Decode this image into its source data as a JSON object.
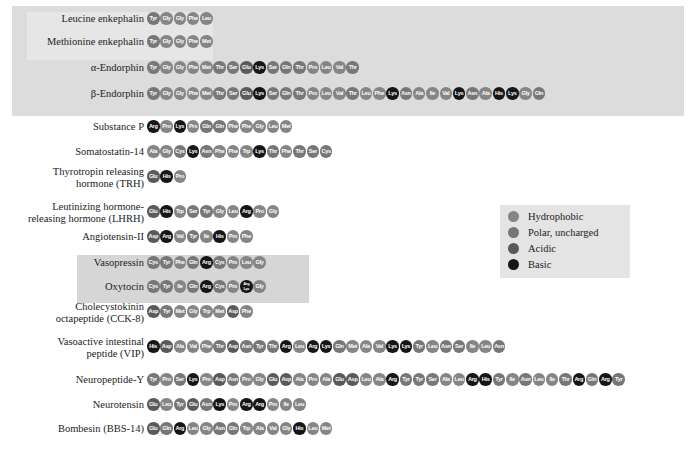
{
  "legend": {
    "items": [
      {
        "label": "Hydrophobic",
        "class": "h",
        "color": "#858585"
      },
      {
        "label": "Polar, uncharged",
        "class": "p",
        "color": "#777777"
      },
      {
        "label": "Acidic",
        "class": "a",
        "color": "#5a5a5a"
      },
      {
        "label": "Basic",
        "class": "b",
        "color": "#161616"
      }
    ]
  },
  "peptides": [
    {
      "name": "Leucine enkephalin",
      "y": 18,
      "seq": [
        "Tyr",
        "Gly",
        "Gly",
        "Phe",
        "Leu"
      ]
    },
    {
      "name": "Methionine enkephalin",
      "y": 41,
      "seq": [
        "Tyr",
        "Gly",
        "Gly",
        "Phe",
        "Met"
      ]
    },
    {
      "name": "α-Endorphin",
      "y": 67,
      "seq": [
        "Tyr",
        "Gly",
        "Gly",
        "Phe",
        "Met",
        "Thr",
        "Ser",
        "Glu",
        "Lys",
        "Ser",
        "Gln",
        "Thr",
        "Pro",
        "Leu",
        "Val",
        "Thr"
      ]
    },
    {
      "name": "β-Endorphin",
      "y": 93,
      "seq": [
        "Tyr",
        "Gly",
        "Gly",
        "Phe",
        "Met",
        "Thr",
        "Ser",
        "Glu",
        "Lys",
        "Ser",
        "Gln",
        "Thr",
        "Pro",
        "Leu",
        "Val",
        "Thr",
        "Leu",
        "Phe",
        "Lys",
        "Asn",
        "Ala",
        "Ile",
        "Val",
        "Lys",
        "Asn",
        "Ala",
        "His",
        "Lys",
        "Gly",
        "Gln"
      ]
    },
    {
      "name": "Substance P",
      "y": 126,
      "seq": [
        "Arg",
        "Pro",
        "Lys",
        "Pro",
        "Gln",
        "Gln",
        "Phe",
        "Phe",
        "Gly",
        "Leu",
        "Met"
      ]
    },
    {
      "name": "Somatostatin-14",
      "y": 151,
      "seq": [
        "Ala",
        "Gly",
        "Cys",
        "Lys",
        "Asn",
        "Phe",
        "Phe",
        "Trp",
        "Lys",
        "Thr",
        "Phe",
        "Thr",
        "Ser",
        "Cys"
      ]
    },
    {
      "name": "Thyrotropin releasing\nhormone (TRH)",
      "y": 176,
      "lines": 2,
      "seq": [
        "Glu",
        "His",
        "Pro"
      ]
    },
    {
      "name": "Leutinizing hormone-\nreleasing hormone (LHRH)",
      "y": 211,
      "lines": 2,
      "seq": [
        "Glu",
        "His",
        "Trp",
        "Ser",
        "Tyr",
        "Gly",
        "Leu",
        "Arg",
        "Pro",
        "Gly"
      ]
    },
    {
      "name": "Angiotensin-II",
      "y": 236,
      "seq": [
        "Asp",
        "Arg",
        "Val",
        "Tyr",
        "Ile",
        "His",
        "Pro",
        "Phe"
      ]
    },
    {
      "name": "Vasopressin",
      "y": 262,
      "seq": [
        "Cys",
        "Tyr",
        "Phe",
        "Gln",
        "Arg",
        "Cys",
        "Pro",
        "Leu",
        "Gly"
      ]
    },
    {
      "name": "Oxytocin",
      "y": 286,
      "seq": [
        "Cys",
        "Tyr",
        "Ile",
        "Gln",
        "Arg",
        "Cys",
        "Pro",
        "Arg/Lys",
        "Gly"
      ]
    },
    {
      "name": "Cholecystokinin\noctapeptide (CCK-8)",
      "y": 311,
      "lines": 2,
      "seq": [
        "Asp",
        "Tyr",
        "Met",
        "Gly",
        "Trp",
        "Met",
        "Asp",
        "Phe"
      ]
    },
    {
      "name": "Vasoactive intestinal\npeptide (VIP)",
      "y": 346,
      "lines": 2,
      "seq": [
        "His",
        "Asp",
        "Ala",
        "Val",
        "Phe",
        "Thr",
        "Asp",
        "Asn",
        "Tyr",
        "Thr",
        "Arg",
        "Leu",
        "Arg",
        "Lys",
        "Gln",
        "Met",
        "Ala",
        "Val",
        "Lys",
        "Lys",
        "Tyr",
        "Leu",
        "Asn",
        "Ser",
        "Ile",
        "Leu",
        "Asn"
      ]
    },
    {
      "name": "Neuropeptide-Y",
      "y": 379,
      "seq": [
        "Tyr",
        "Pro",
        "Ser",
        "Lys",
        "Pro",
        "Asp",
        "Asn",
        "Pro",
        "Gly",
        "Glu",
        "Asp",
        "Ala",
        "Pro",
        "Ala",
        "Glu",
        "Asp",
        "Leu",
        "Ala",
        "Arg",
        "Tyr",
        "Tyr",
        "Ser",
        "Ala",
        "Leu",
        "Arg",
        "His",
        "Tyr",
        "Ile",
        "Asn",
        "Leu",
        "Ile",
        "Thr",
        "Arg",
        "Gln",
        "Arg",
        "Tyr"
      ]
    },
    {
      "name": "Neurotensin",
      "y": 404,
      "seq": [
        "Glu",
        "Leu",
        "Tyr",
        "Glu",
        "Asn",
        "Lys",
        "Pro",
        "Arg",
        "Arg",
        "Pro",
        "Ile",
        "Leu"
      ]
    },
    {
      "name": "Bombesin (BBS-14)",
      "y": 428,
      "seq": [
        "Glu",
        "Gln",
        "Arg",
        "Leu",
        "Gly",
        "Asn",
        "Gln",
        "Trp",
        "Ala",
        "Val",
        "Gly",
        "His",
        "Leu",
        "Met"
      ]
    }
  ],
  "aa_class": {
    "Ala": "h",
    "Val": "h",
    "Leu": "h",
    "Ile": "h",
    "Met": "h",
    "Phe": "h",
    "Trp": "h",
    "Pro": "h",
    "Gly": "h",
    "Ser": "p",
    "Thr": "p",
    "Cys": "p",
    "Tyr": "p",
    "Asn": "p",
    "Gln": "p",
    "Asp": "a",
    "Glu": "a",
    "Lys": "b",
    "Arg": "b",
    "His": "b",
    "Arg/Lys": "b"
  }
}
